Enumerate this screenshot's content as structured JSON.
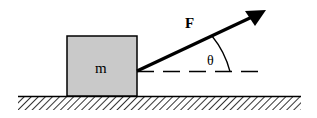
{
  "diagram": {
    "labels": {
      "mass": "m",
      "force": "F",
      "angle": "θ"
    },
    "colors": {
      "block_fill": "#c9c9c9",
      "stroke": "#000000",
      "background": "#ffffff"
    }
  }
}
